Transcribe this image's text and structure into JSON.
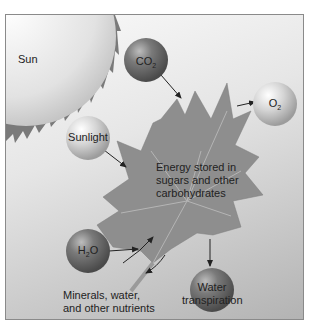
{
  "diagram": {
    "sun": {
      "label": "Sun"
    },
    "molecules": {
      "co2": {
        "base": "CO",
        "sub": "2"
      },
      "o2": {
        "base": "O",
        "sub": "2"
      },
      "h2o": {
        "base": "H",
        "sub": "2",
        "tail": "O"
      },
      "sunlight": {
        "label": "Sunlight"
      },
      "water_transpiration": {
        "line1": "Water",
        "line2": "transpiration"
      }
    },
    "leaf_text": {
      "line1": "Energy stored in",
      "line2": "sugars and other",
      "line3": "carbohydrates"
    },
    "nutrients_text": {
      "line1": "Minerals, water,",
      "line2": "and other nutrients"
    },
    "colors": {
      "dark_ball": "#6b6b6b",
      "light_ball": "#d8d8d8",
      "leaf": "#8e8e8e",
      "sun": "#e8e8e8",
      "sun_rays": "#7a7a7a"
    }
  }
}
